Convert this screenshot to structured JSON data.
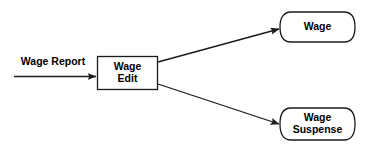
{
  "diagram": {
    "type": "data-flow-diagram",
    "background_color": "#ffffff",
    "line_color": "#1a1a1a",
    "shape_fill": "#ffffff",
    "nodes": [
      {
        "id": "wage-edit",
        "shape": "rectangle",
        "role": "process",
        "label_line_1": "Wage",
        "label_line_2": "Edit"
      },
      {
        "id": "wage-store",
        "shape": "cylinder",
        "role": "data-store",
        "label_line_1": "Wage",
        "label_line_2": ""
      },
      {
        "id": "wage-suspense-store",
        "shape": "cylinder",
        "role": "data-store",
        "label_line_1": "Wage",
        "label_line_2": "Suspense"
      }
    ],
    "flows": [
      {
        "id": "wage-report-input",
        "label": "Wage Report",
        "from": "external",
        "to": "wage-edit",
        "arrowhead": true
      },
      {
        "id": "wage-edit-to-wage",
        "label": "",
        "from": "wage-edit",
        "to": "wage-store",
        "arrowhead": true
      },
      {
        "id": "wage-edit-to-wage-suspense",
        "label": "",
        "from": "wage-edit",
        "to": "wage-suspense-store",
        "arrowhead": true
      }
    ]
  }
}
